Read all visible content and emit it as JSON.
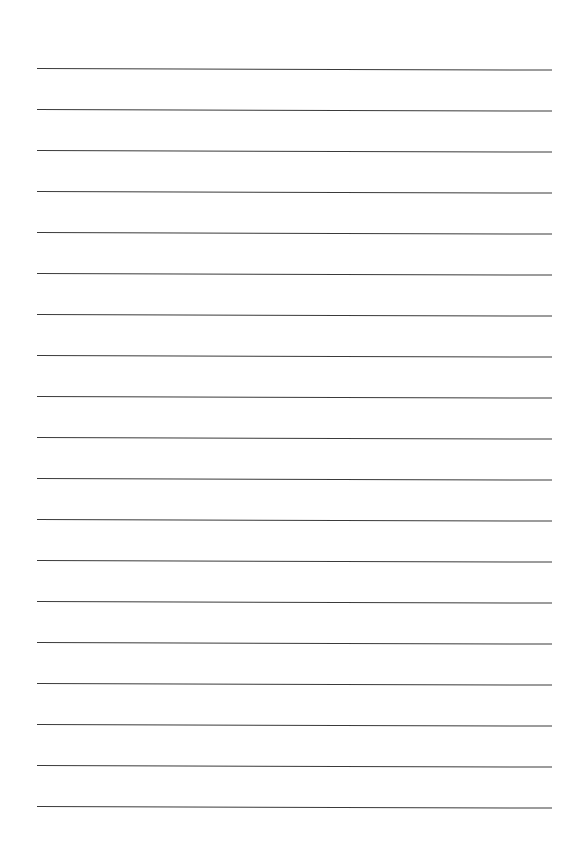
{
  "page": {
    "width": 568,
    "height": 866,
    "background_color": "#ffffff",
    "content_text": ""
  },
  "ruling": {
    "line_color": "#3a3a3a",
    "line_thickness_px": 1.5,
    "line_count": 19,
    "left_margin_px": 37,
    "right_end_px": 552,
    "line_length_px": 515,
    "first_line_y_px": 68,
    "last_line_y_px": 806,
    "line_spacing_px": 41,
    "skew_degrees": 0.18,
    "orientation": "horizontal",
    "has_vertical_margin_rule": false,
    "has_holes": false,
    "has_header": false,
    "lines_y": [
      68,
      109,
      150,
      191,
      232,
      273,
      314,
      355,
      396,
      437,
      478,
      519,
      560,
      601,
      642,
      683,
      724,
      765,
      806
    ],
    "line_labels": [
      "rule-line-1",
      "rule-line-2",
      "rule-line-3",
      "rule-line-4",
      "rule-line-5",
      "rule-line-6",
      "rule-line-7",
      "rule-line-8",
      "rule-line-9",
      "rule-line-10",
      "rule-line-11",
      "rule-line-12",
      "rule-line-13",
      "rule-line-14",
      "rule-line-15",
      "rule-line-16",
      "rule-line-17",
      "rule-line-18",
      "rule-line-19"
    ]
  }
}
